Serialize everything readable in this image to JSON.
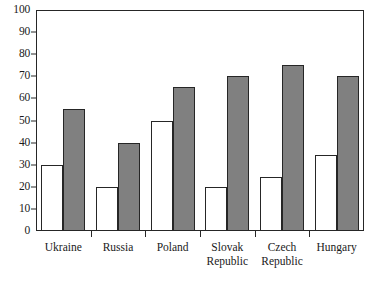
{
  "chart_data": {
    "type": "bar",
    "title": "",
    "xlabel": "",
    "ylabel": "",
    "ylim": [
      0,
      100
    ],
    "y_ticks": [
      0,
      10,
      20,
      30,
      40,
      50,
      60,
      70,
      80,
      90,
      100
    ],
    "grid": false,
    "legend": "none",
    "categories": [
      "Ukraine",
      "Russia",
      "Poland",
      "Slovak Republic",
      "Czech Republic",
      "Hungary"
    ],
    "category_lines": [
      [
        "Ukraine"
      ],
      [
        "Russia"
      ],
      [
        "Poland"
      ],
      [
        "Slovak",
        "Republic"
      ],
      [
        "Czech",
        "Republic"
      ],
      [
        "Hungary"
      ]
    ],
    "series": [
      {
        "name": "open-series",
        "fill": "#ffffff",
        "values": [
          30,
          20,
          50,
          20,
          24.5,
          34.5
        ]
      },
      {
        "name": "solid-series",
        "fill": "#808080",
        "values": [
          55,
          40,
          65,
          70,
          75,
          70
        ]
      }
    ]
  },
  "colors": {
    "axis": "#262626",
    "open_bar": "#ffffff",
    "solid_bar": "#808080",
    "background": "#ffffff"
  }
}
